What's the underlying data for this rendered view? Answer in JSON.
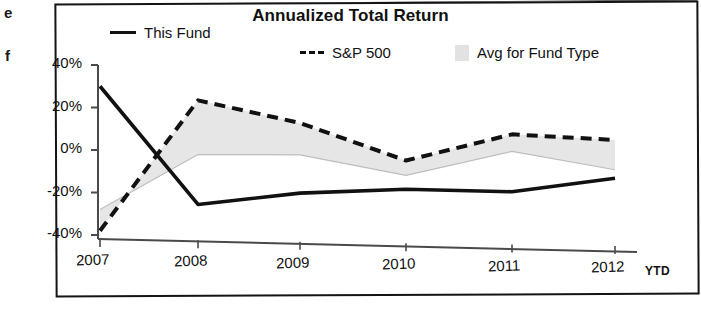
{
  "chart_data": {
    "type": "line",
    "title": "Annualized Total Return",
    "xlabel": "",
    "ylabel": "",
    "x": [
      "2007",
      "2008",
      "2009",
      "2010",
      "2011",
      "2012"
    ],
    "categories": [
      "2007",
      "2008",
      "2009",
      "2010",
      "2011",
      "2012"
    ],
    "x_tick_suffix": "YTD",
    "ylim": [
      -40,
      40
    ],
    "ytick_labels": [
      "40%",
      "20%",
      "0%",
      "-20%",
      "-40%"
    ],
    "ytick_values": [
      40,
      20,
      0,
      -20,
      -40
    ],
    "grid": false,
    "legend_position": "top",
    "series": [
      {
        "name": "This Fund",
        "style": "solid",
        "color": "#111111",
        "values": [
          30,
          -25,
          -19,
          -16.5,
          -17,
          -10
        ]
      },
      {
        "name": "S&P 500",
        "style": "dashed",
        "color": "#111111",
        "values": [
          -38,
          24,
          14,
          -3,
          10,
          8
        ]
      },
      {
        "name": "Avg for Fund Type",
        "style": "area",
        "color": "#e2e2e2",
        "values": [
          -28,
          -1.5,
          -1,
          -10,
          2,
          -6
        ]
      }
    ],
    "legend": [
      {
        "label": "This Fund",
        "swatch": "solid-line"
      },
      {
        "label": "S&P 500",
        "swatch": "dashed-line"
      },
      {
        "label": "Avg for Fund Type",
        "swatch": "gray-box"
      }
    ],
    "colors": {
      "line": "#111111",
      "band": "#e2e2e2",
      "axis": "#4a4a4a",
      "frame": "#141414"
    }
  },
  "page_bleed": {
    "letter_top": "e",
    "letter_bottom": "f"
  }
}
